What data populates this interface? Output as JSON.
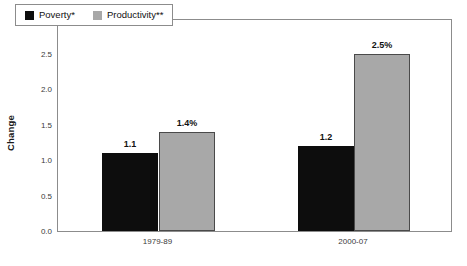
{
  "chart_data": {
    "type": "bar",
    "title": "",
    "subtitle": "",
    "xlabel": "",
    "ylabel": "Change",
    "ylim": [
      0.0,
      3.0
    ],
    "ytick_step": 0.5,
    "yticks": [
      "0.0",
      "0.5",
      "1.0",
      "1.5",
      "2.0",
      "2.5",
      "3.0"
    ],
    "grid": false,
    "legend_position": "top-left",
    "categories": [
      "1979-89",
      "2000-07"
    ],
    "series": [
      {
        "name": "Poverty*",
        "color": "#0d0d0d",
        "values": [
          1.1,
          1.2
        ],
        "labels": [
          "1.1",
          "1.2"
        ]
      },
      {
        "name": "Productivity**",
        "color": "#a8a8a8",
        "values": [
          1.4,
          2.5
        ],
        "labels": [
          "1.4%",
          "2.5%"
        ]
      }
    ]
  },
  "axes": {
    "y_title": "Change"
  },
  "legend": {
    "entries": [
      {
        "label": "Poverty*"
      },
      {
        "label": "Productivity**"
      }
    ]
  }
}
